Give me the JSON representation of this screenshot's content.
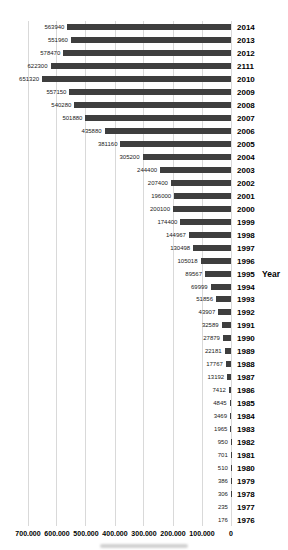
{
  "chart_data": {
    "type": "bar",
    "orientation": "horizontal",
    "title": "",
    "xlabel": "",
    "ylabel": "Year",
    "ylabel_attached_to_category": "1995",
    "axis_reversed": true,
    "xlim": [
      700000,
      0
    ],
    "x_ticks": [
      "700.000",
      "600.000",
      "500.000",
      "400.000",
      "300.000",
      "200.000",
      "100.000",
      "0"
    ],
    "categories": [
      "2014",
      "2013",
      "2012",
      "2111",
      "2010",
      "2009",
      "2008",
      "2007",
      "2006",
      "2005",
      "2004",
      "2003",
      "2002",
      "2001",
      "2000",
      "1999",
      "1998",
      "1997",
      "1996",
      "1995",
      "1994",
      "1993",
      "1992",
      "1991",
      "1990",
      "1989",
      "1988",
      "1987",
      "1986",
      "1985",
      "1984",
      "1983",
      "1982",
      "1981",
      "1980",
      "1979",
      "1978",
      "1977",
      "1976"
    ],
    "values": [
      563940,
      551960,
      578470,
      622300,
      651320,
      557150,
      540280,
      501880,
      435880,
      381160,
      305200,
      244400,
      207400,
      196000,
      200100,
      174400,
      144967,
      130498,
      105018,
      89567,
      69999,
      51856,
      43907,
      32589,
      27879,
      22181,
      17767,
      13192,
      7412,
      4845,
      3469,
      1965,
      950,
      701,
      510,
      386,
      306,
      235,
      176
    ],
    "axis_max": 700000,
    "bar_color": "#3e3e3e",
    "gridline_color": "#d9d9d9",
    "grid": true,
    "legend": false
  }
}
